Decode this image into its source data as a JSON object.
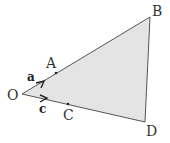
{
  "diagram": {
    "points": {
      "O": "O",
      "A": "A",
      "B": "B",
      "C": "C",
      "D": "D"
    },
    "vectors": {
      "a": "a",
      "c": "c"
    },
    "colors": {
      "fill": "#e4e4e4",
      "stroke": "#555555"
    }
  }
}
